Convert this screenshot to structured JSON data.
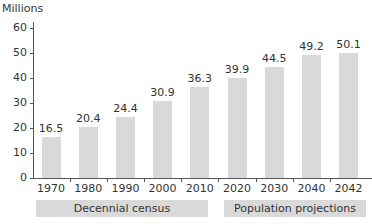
{
  "chart_data": {
    "type": "bar",
    "title": "",
    "ylabel": "Millions",
    "xlabel": "",
    "ylim": [
      0,
      60
    ],
    "yticks": [
      0,
      10,
      20,
      30,
      40,
      50,
      60
    ],
    "categories": [
      "1970",
      "1980",
      "1990",
      "2000",
      "2010",
      "2020",
      "2030",
      "2040",
      "2042"
    ],
    "values": [
      16.5,
      20.4,
      24.4,
      30.9,
      36.3,
      39.9,
      44.5,
      49.2,
      50.1
    ],
    "value_labels": [
      "16.5",
      "20.4",
      "24.4",
      "30.9",
      "36.3",
      "39.9",
      "44.5",
      "49.2",
      "50.1"
    ],
    "groups": [
      {
        "label": "Decennial census",
        "categories": [
          "1970",
          "1980",
          "1990",
          "2000",
          "2010"
        ]
      },
      {
        "label": "Population projections",
        "categories": [
          "2020",
          "2030",
          "2040",
          "2042"
        ]
      }
    ],
    "grid": false,
    "bar_color": "#d9d9d9"
  },
  "axis": {
    "y_title": "Millions",
    "y_ticks": [
      "0",
      "10",
      "20",
      "30",
      "40",
      "50",
      "60"
    ]
  },
  "groups": {
    "census_label": "Decennial census",
    "projections_label": "Population projections"
  }
}
